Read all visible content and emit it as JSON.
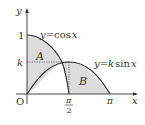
{
  "diagram": {
    "title": "",
    "axes": {
      "x_label": "x",
      "y_label": "y",
      "origin_label": "O"
    },
    "ticks": {
      "y_one": "1",
      "y_k": "k",
      "x_pi_over_2_num": "π",
      "x_pi_over_2_den": "2",
      "x_pi": "π"
    },
    "curves": [
      {
        "name": "cos",
        "label": "y = cos x",
        "label_parts": [
          "y",
          "=",
          "cos",
          "x"
        ]
      },
      {
        "name": "ksin",
        "label": "y = k sin x",
        "label_parts": [
          "y",
          "=",
          "k",
          "sin",
          "x"
        ]
      }
    ],
    "regions": [
      {
        "name": "A",
        "label": "A",
        "description": "between y-axis, y=cos x and y=k sin x, above intersection"
      },
      {
        "name": "B",
        "label": "B",
        "description": "between y=k sin x, y=cos x and x-axis from intersection to π"
      }
    ],
    "colors": {
      "axis": "#333333",
      "curve": "#2a2a2a",
      "fill": "#dcdcdc",
      "dotted": "#555555"
    }
  }
}
